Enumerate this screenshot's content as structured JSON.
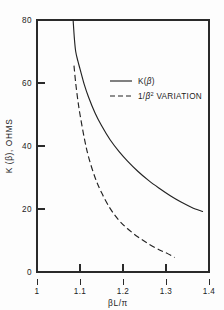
{
  "chart_data": {
    "type": "line",
    "title": "",
    "xlabel": "βL/π",
    "ylabel": "K (β), OHMS",
    "xlim": [
      1.0,
      1.4
    ],
    "ylim": [
      0,
      80
    ],
    "grid": false,
    "legend_position": "upper-center-right",
    "x_ticks": [
      "1",
      "1.1",
      "1.2",
      "1.3",
      "1.4"
    ],
    "x_tick_values": [
      1.0,
      1.1,
      1.2,
      1.3,
      1.4
    ],
    "y_ticks": [
      "0",
      "20",
      "40",
      "60",
      "80"
    ],
    "y_tick_values": [
      0,
      20,
      40,
      60,
      80
    ],
    "series": [
      {
        "name": "K(β)",
        "style": "solid",
        "x": [
          1.084,
          1.087,
          1.09,
          1.095,
          1.1,
          1.11,
          1.12,
          1.135,
          1.15,
          1.17,
          1.19,
          1.21,
          1.235,
          1.26,
          1.285,
          1.31,
          1.335,
          1.36,
          1.385
        ],
        "y": [
          80.0,
          74.0,
          70.0,
          67.0,
          64.5,
          59.5,
          55.5,
          50.5,
          46.5,
          42.0,
          38.4,
          35.3,
          31.9,
          29.0,
          26.5,
          24.2,
          22.2,
          20.5,
          19.2
        ]
      },
      {
        "name": "1/β² VARIATION",
        "style": "dashed",
        "x": [
          1.086,
          1.09,
          1.095,
          1.1,
          1.11,
          1.12,
          1.135,
          1.15,
          1.17,
          1.19,
          1.21,
          1.235,
          1.26,
          1.285,
          1.3,
          1.32
        ],
        "y": [
          65.5,
          60.0,
          54.5,
          50.0,
          42.5,
          36.5,
          30.0,
          25.2,
          20.2,
          16.5,
          13.8,
          11.1,
          8.9,
          7.0,
          6.1,
          4.6
        ]
      }
    ]
  },
  "legend": {
    "entries": [
      {
        "label": "K(β)",
        "style": "solid"
      },
      {
        "label_prefix": "1/",
        "label_base": "β",
        "label_sup": "2",
        "label_suffix": " VARIATION",
        "style": "dashed"
      }
    ]
  },
  "axes": {
    "y_axis_label": "K (β), OHMS",
    "x_axis_label": "βL/π"
  },
  "colors": {
    "curve": "#232323",
    "axis": "#2a2a2a",
    "background": "#fdfdfd",
    "text": "#1c1c1c"
  }
}
